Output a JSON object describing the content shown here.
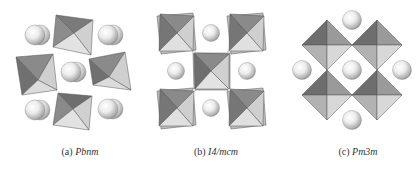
{
  "figure": {
    "panels": [
      {
        "id": "a",
        "label": "(a)",
        "space_group": "Pbnm",
        "caption_x": 80
      },
      {
        "id": "b",
        "label": "(b)",
        "space_group": "I4/mcm",
        "caption_x": 216
      },
      {
        "id": "c",
        "label": "(c)",
        "space_group": "Pm3m",
        "caption_x": 358
      }
    ]
  },
  "colors": {
    "dark_face": "#7a7a7a",
    "mid_face": "#a6a6a6",
    "light_face": "#d4d4d4",
    "lighter_face": "#e6e6e6",
    "edge": "#555555",
    "sphere_highlight": "#ffffff",
    "sphere_shadow": "#9a9a9a",
    "caption_text": "#333333"
  }
}
